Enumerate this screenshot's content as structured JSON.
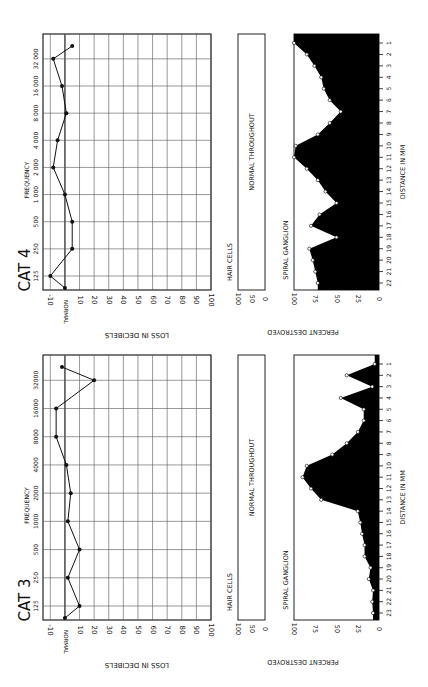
{
  "chart_data": [
    {
      "panel": "CAT 4",
      "title": "CAT 4",
      "audiogram": {
        "type": "line",
        "xlabel": "FREQUENCY",
        "ylabel": "LOSS IN DECIBELS",
        "frequencies": [
          "125",
          "250",
          "500",
          "1 000",
          "2 000",
          "4 000",
          "8 000",
          "16 000",
          "32 000"
        ],
        "db_ticks": [
          "-10",
          "NORMAL",
          "10",
          "20",
          "30",
          "40",
          "50",
          "60",
          "70",
          "80",
          "90",
          "100"
        ],
        "points": [
          {
            "f": "~100",
            "db": 0
          },
          {
            "f": "125",
            "db": -10
          },
          {
            "f": "250",
            "db": 5
          },
          {
            "f": "500",
            "db": 5
          },
          {
            "f": "1 000",
            "db": 0
          },
          {
            "f": "2 000",
            "db": -8
          },
          {
            "f": "4 000",
            "db": -5
          },
          {
            "f": "8 000",
            "db": 1
          },
          {
            "f": "16 000",
            "db": -2
          },
          {
            "f": "32 000",
            "db": -8
          },
          {
            "f": "~40 000",
            "db": 5
          }
        ],
        "ylim": [
          -10,
          100
        ]
      },
      "hair_cells": {
        "label": "HAIR CELLS",
        "ticks": [
          "100",
          "50",
          "0"
        ],
        "note": "NORMAL THROUGHOUT"
      },
      "spiral_ganglion": {
        "type": "area",
        "label": "SPIRAL GANGLION",
        "ylabel": "PERCENT DESTROYED",
        "xlabel": "DISTANCE IN MM",
        "pct_ticks": [
          "100",
          "75",
          "50",
          "25",
          "0"
        ],
        "distance_mm": [
          1,
          2,
          3,
          4,
          5,
          6,
          7,
          8,
          9,
          10,
          11,
          12,
          13,
          14,
          15,
          16,
          17,
          18,
          19,
          20,
          21,
          22
        ],
        "percent_destroyed": [
          100,
          85,
          76,
          68,
          65,
          58,
          45,
          58,
          72,
          98,
          100,
          85,
          72,
          63,
          50,
          70,
          80,
          50,
          82,
          78,
          75,
          72
        ],
        "ylim": [
          0,
          100
        ]
      }
    },
    {
      "panel": "CAT 3",
      "title": "CAT 3",
      "audiogram": {
        "type": "line",
        "xlabel": "FREQUENCY",
        "ylabel": "LOSS IN DECIBELS",
        "frequencies": [
          "125",
          "250",
          "500",
          "1000",
          "2000",
          "4000",
          "8000",
          "16000",
          "32000"
        ],
        "db_ticks": [
          "-10",
          "NORMAL",
          "10",
          "20",
          "30",
          "40",
          "50",
          "60",
          "70",
          "80",
          "90",
          "100"
        ],
        "points": [
          {
            "f": "~100",
            "db": 0
          },
          {
            "f": "125",
            "db": 10
          },
          {
            "f": "250",
            "db": 2
          },
          {
            "f": "500",
            "db": 10
          },
          {
            "f": "1000",
            "db": 2
          },
          {
            "f": "2000",
            "db": 4
          },
          {
            "f": "4000",
            "db": 1
          },
          {
            "f": "8000",
            "db": -6
          },
          {
            "f": "16000",
            "db": -6
          },
          {
            "f": "32000",
            "db": 20
          },
          {
            "f": "~40000",
            "db": -2
          }
        ],
        "ylim": [
          -10,
          100
        ]
      },
      "hair_cells": {
        "label": "HAIR CELLS",
        "ticks": [
          "100",
          "50",
          "0"
        ],
        "note": "NORMAL THROUGHOUT"
      },
      "spiral_ganglion": {
        "type": "area",
        "label": "SPIRAL GANGLION",
        "ylabel": "PERCENT DESTROYED",
        "xlabel": "DISTANCE IN MM",
        "pct_ticks": [
          "100",
          "75",
          "50",
          "25",
          "0"
        ],
        "distance_mm": [
          1,
          2,
          3,
          4,
          5,
          6,
          7,
          8,
          9,
          10,
          11,
          12,
          13,
          14,
          15,
          16,
          17,
          18,
          19,
          20,
          21,
          22,
          23
        ],
        "percent_destroyed": [
          5,
          38,
          8,
          45,
          18,
          18,
          25,
          38,
          55,
          85,
          90,
          80,
          68,
          25,
          22,
          20,
          17,
          17,
          10,
          12,
          7,
          8,
          7
        ],
        "ylim": [
          0,
          100
        ]
      }
    }
  ],
  "labels": {
    "cat4": "CAT 4",
    "cat3": "CAT 3",
    "frequency": "FREQUENCY",
    "loss_db": "LOSS IN DECIBELS",
    "hair_cells": "HAIR CELLS",
    "normal_throughout": "NORMAL THROUGHOUT",
    "spiral_ganglion": "SPIRAL GANGLION",
    "percent_destroyed": "PERCENT DESTROYED",
    "distance_mm": "DISTANCE IN MM",
    "normal": "NORMAL"
  }
}
